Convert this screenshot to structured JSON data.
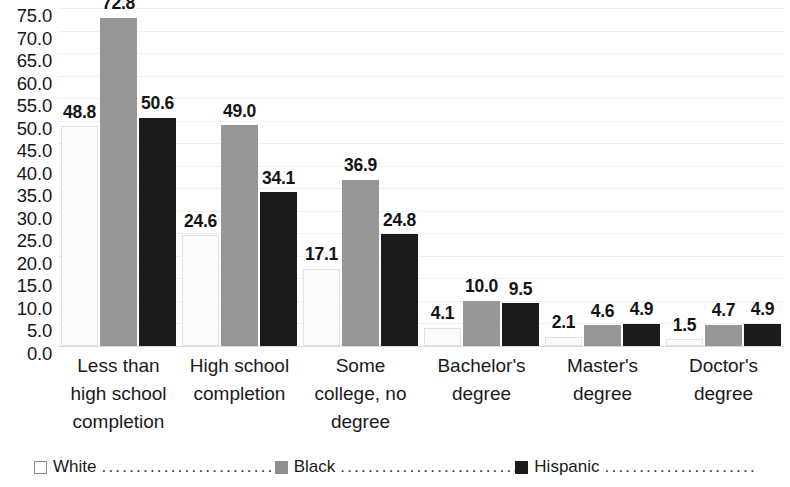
{
  "chart_data": {
    "type": "bar",
    "title": "",
    "subtitle": "",
    "xlabel": "",
    "ylabel": "",
    "ylim": [
      0.0,
      75.0
    ],
    "ytick_step": 5.0,
    "grid": true,
    "legend_position": "bottom",
    "categories": [
      "Less than high school completion",
      "High school completion",
      "Some college, no degree",
      "Bachelor's degree",
      "Master's degree",
      "Doctor's degree"
    ],
    "category_lines": [
      [
        "Less than",
        "high school",
        "completion"
      ],
      [
        "High school",
        "completion"
      ],
      [
        "Some",
        "college, no",
        "degree"
      ],
      [
        "Bachelor's",
        "degree"
      ],
      [
        "Master's",
        "degree"
      ],
      [
        "Doctor's",
        "degree"
      ]
    ],
    "series": [
      {
        "name": "White",
        "color": "#fbfbfb",
        "values": [
          48.8,
          24.6,
          17.1,
          4.1,
          2.1,
          1.5
        ],
        "labels": [
          "48.8",
          "24.6",
          "17.1",
          "4.1",
          "2.1",
          "1.5"
        ]
      },
      {
        "name": "Black",
        "color": "#979797",
        "values": [
          72.8,
          49.0,
          36.9,
          10.0,
          4.6,
          4.7
        ],
        "labels": [
          "72.8",
          "49.0",
          "36.9",
          "10.0",
          "4.6",
          "4.7"
        ]
      },
      {
        "name": "Hispanic",
        "color": "#1b1b1b",
        "values": [
          50.6,
          34.1,
          24.8,
          9.5,
          4.9,
          4.9
        ],
        "labels": [
          "50.6",
          "34.1",
          "24.8",
          "9.5",
          "4.9",
          "4.9"
        ]
      }
    ],
    "ytick_labels": [
      "75.0",
      "70.0",
      "65.0",
      "60.0",
      "55.0",
      "50.0",
      "45.0",
      "40.0",
      "35.0",
      "30.0",
      "25.0",
      "20.0",
      "15.0",
      "10.0",
      "5.0",
      "0.0"
    ],
    "ytick_values": [
      75.0,
      70.0,
      65.0,
      60.0,
      55.0,
      50.0,
      45.0,
      40.0,
      35.0,
      30.0,
      25.0,
      20.0,
      15.0,
      10.0,
      5.0,
      0.0
    ]
  },
  "legend": {
    "items": [
      {
        "label": "White",
        "swatch": "white",
        "dots": "............................................"
      },
      {
        "label": "Black",
        "swatch": "gray",
        "dots": "............................................"
      },
      {
        "label": "Hispanic",
        "swatch": "black",
        "dots": "............................................"
      }
    ]
  }
}
